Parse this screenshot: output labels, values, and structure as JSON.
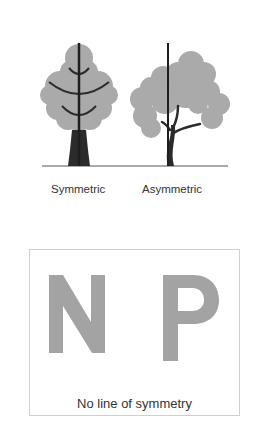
{
  "figure": {
    "trees": [
      {
        "id": "symmetric",
        "label": "Symmetric",
        "has_symmetry_line": true
      },
      {
        "id": "asymmetric",
        "label": "Asymmetric",
        "has_symmetry_line": true
      }
    ],
    "letters_panel": {
      "letters": [
        "N",
        "P"
      ],
      "caption": "No line of symmetry"
    },
    "colors": {
      "canopy": "#aaaaaa",
      "trunk": "#2b2b2b",
      "axis_line": "#1e1e1e",
      "ground": "#555555",
      "letter_fill": "#a3a3a3",
      "box_border": "#cfcfcf",
      "text": "#333333"
    }
  }
}
